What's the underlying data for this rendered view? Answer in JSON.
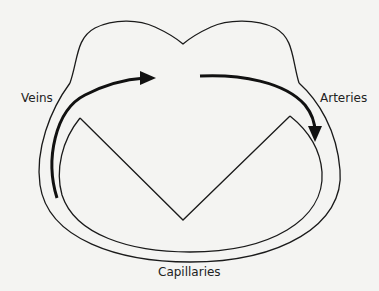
{
  "diagram": {
    "labels": {
      "veins": "Veins",
      "arteries": "Arteries",
      "capillaries": "Capillaries"
    },
    "colors": {
      "background": "#f4f4f2",
      "line": "#1a1a1a",
      "text": "#222222"
    }
  }
}
